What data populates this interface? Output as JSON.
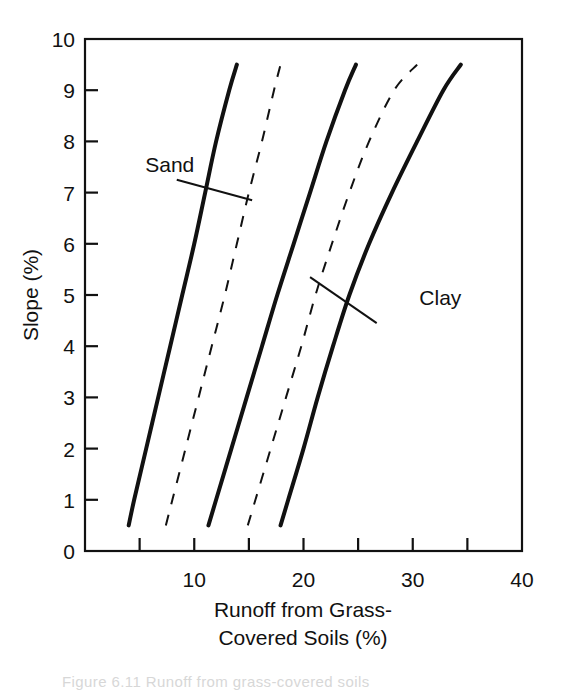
{
  "figure": {
    "background_color": "#ffffff",
    "ink_color": "#111111"
  },
  "axes": {
    "y_title": "Slope (%)",
    "x_title_line1": "Runoff from Grass-",
    "x_title_line2": "Covered Soils (%)",
    "y_ticks": [
      "0",
      "1",
      "2",
      "3",
      "4",
      "5",
      "6",
      "7",
      "8",
      "9",
      "10"
    ],
    "x_ticks": [
      "10",
      "20",
      "30",
      "40"
    ]
  },
  "labels": {
    "sand": "Sand",
    "clay": "Clay"
  },
  "footer": {
    "cut_off_caption": "Figure 6.11   Runoff from grass-covered soils"
  },
  "chart_data": {
    "type": "line",
    "title": "",
    "xlabel": "Runoff from Grass-Covered Soils (%)",
    "ylabel": "Slope (%)",
    "xlim": [
      0,
      40
    ],
    "ylim": [
      0,
      10
    ],
    "x_major_tick_labels": [
      10,
      20,
      30,
      40
    ],
    "x_tick_interval": 5,
    "y_tick_interval": 1,
    "grid": false,
    "legend": "inline-annotations",
    "series": [
      {
        "name": "Sand (lower bound)",
        "style": "solid",
        "linewidth": 4,
        "y": [
          0.5,
          1,
          2,
          3,
          4,
          5,
          6,
          7,
          8,
          9,
          9.5
        ],
        "x": [
          4.0,
          4.5,
          5.6,
          6.7,
          7.8,
          8.9,
          10.0,
          11.0,
          12.0,
          13.2,
          13.9
        ]
      },
      {
        "name": "Sand (upper bound)",
        "style": "dashed",
        "linewidth": 2,
        "y": [
          0.5,
          1,
          2,
          3,
          4,
          5,
          6,
          7,
          8,
          9,
          9.5
        ],
        "x": [
          7.4,
          8.0,
          9.2,
          10.4,
          11.6,
          12.8,
          13.9,
          15.0,
          16.2,
          17.3,
          17.9
        ]
      },
      {
        "name": "Loam (mid)",
        "style": "solid",
        "linewidth": 4,
        "y": [
          0.5,
          1,
          2,
          3,
          4,
          5,
          6,
          7,
          8,
          9,
          9.5
        ],
        "x": [
          11.3,
          12.0,
          13.4,
          14.8,
          16.2,
          17.6,
          19.1,
          20.6,
          22.1,
          23.8,
          24.8
        ]
      },
      {
        "name": "Clay (lower bound)",
        "style": "dashed",
        "linewidth": 2,
        "y": [
          0.5,
          1,
          2,
          3,
          4,
          5,
          6,
          7,
          8,
          9,
          9.5
        ],
        "x": [
          14.9,
          15.6,
          17.0,
          18.4,
          19.8,
          21.1,
          22.6,
          24.2,
          26.0,
          28.3,
          30.4
        ]
      },
      {
        "name": "Clay (upper bound)",
        "style": "solid",
        "linewidth": 4,
        "y": [
          0.5,
          1,
          2,
          3,
          4,
          5,
          6,
          7,
          8,
          9,
          9.5
        ],
        "x": [
          17.9,
          18.6,
          20.0,
          21.3,
          22.7,
          24.2,
          26.0,
          28.1,
          30.4,
          32.8,
          34.4
        ]
      }
    ],
    "annotations": [
      {
        "text": "Sand",
        "text_x": 10.0,
        "text_y": 7.4,
        "leader_from_x": 8.4,
        "leader_from_y": 7.25,
        "leader_to_x": 15.3,
        "leader_to_y": 6.85
      },
      {
        "text": "Clay",
        "text_x": 30.6,
        "text_y": 4.8,
        "leader_from_x": 20.6,
        "leader_from_y": 5.35,
        "leader_to_x": 26.7,
        "leader_to_y": 4.45
      }
    ]
  }
}
